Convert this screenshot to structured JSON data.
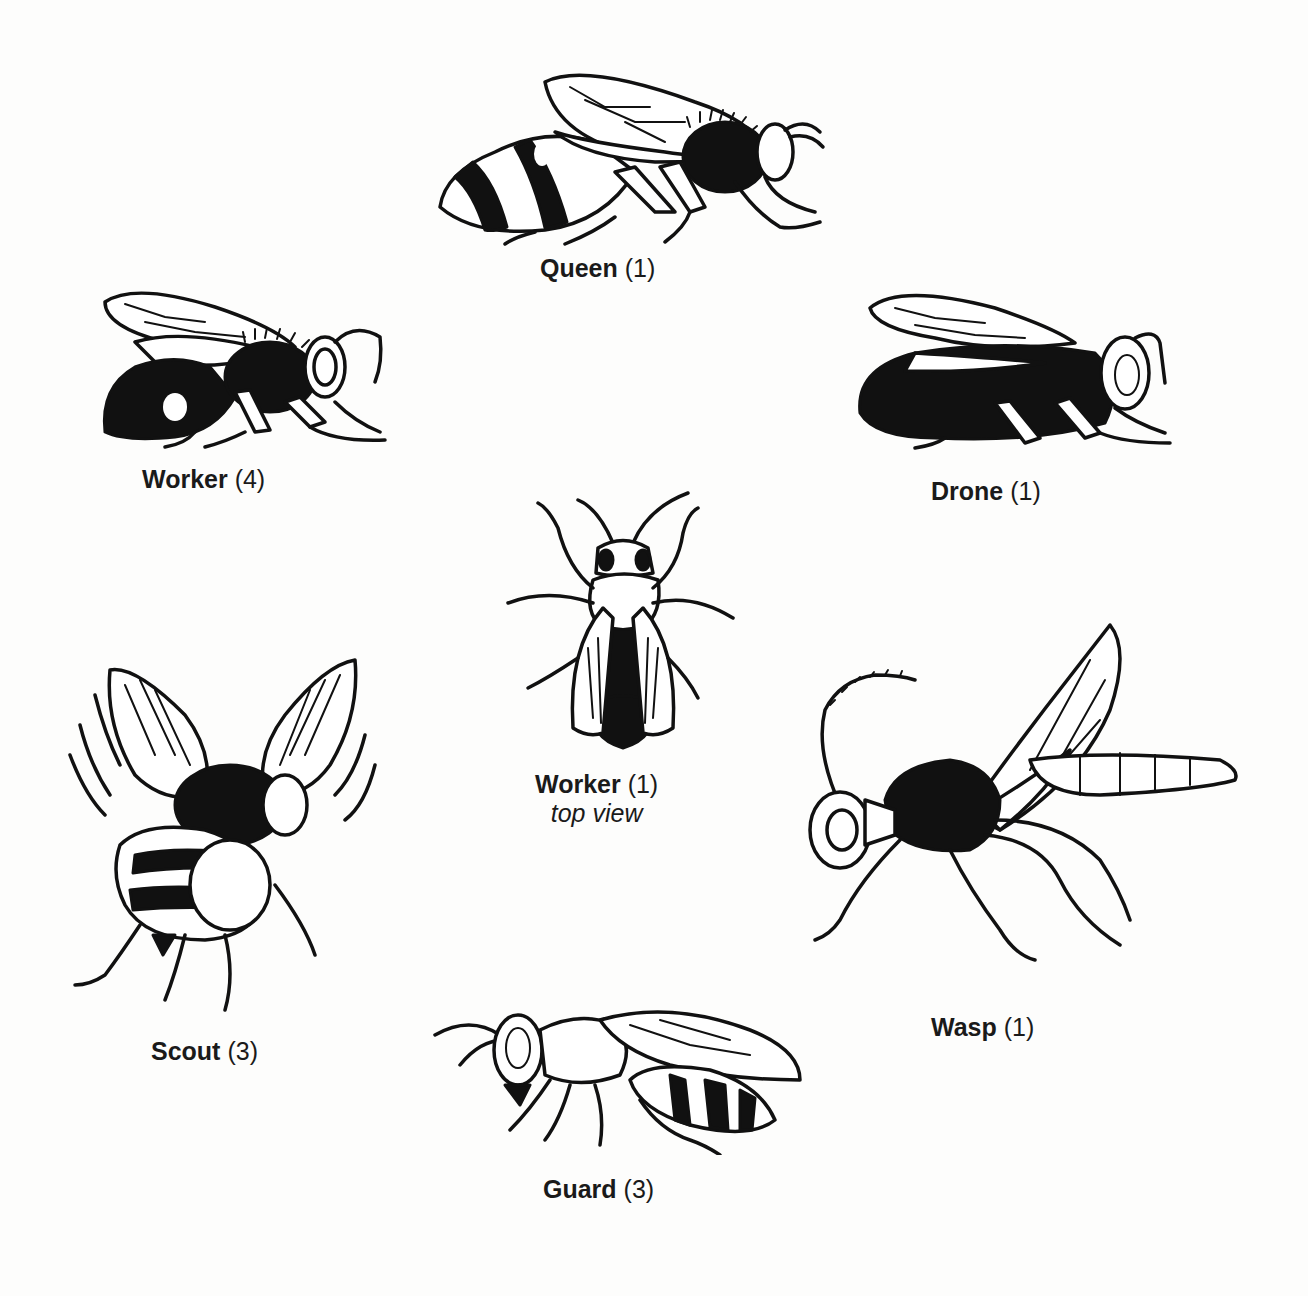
{
  "diagram": {
    "background": "#fdfdfc",
    "ink_color": "#111111",
    "figures": [
      {
        "id": "queen",
        "name": "Queen",
        "count": "(1)",
        "sub": ""
      },
      {
        "id": "worker-side",
        "name": "Worker",
        "count": "(4)",
        "sub": ""
      },
      {
        "id": "drone",
        "name": "Drone",
        "count": "(1)",
        "sub": ""
      },
      {
        "id": "worker-top",
        "name": "Worker",
        "count": "(1)",
        "sub": "top view"
      },
      {
        "id": "scout",
        "name": "Scout",
        "count": "(3)",
        "sub": ""
      },
      {
        "id": "wasp",
        "name": "Wasp",
        "count": "(1)",
        "sub": ""
      },
      {
        "id": "guard",
        "name": "Guard",
        "count": "(3)",
        "sub": ""
      }
    ]
  }
}
